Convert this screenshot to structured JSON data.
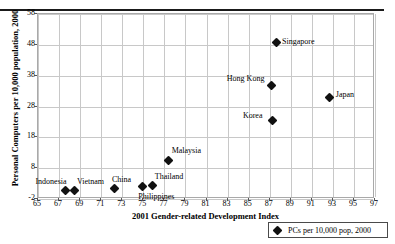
{
  "chart_data": {
    "type": "scatter",
    "title": "",
    "xlabel": "2001 Gender-related Development Index",
    "ylabel": "Personal Computers per 10,000 population, 2000",
    "xlim": [
      65,
      97
    ],
    "ylim": [
      -2,
      58
    ],
    "xticks": [
      65,
      67,
      69,
      71,
      73,
      75,
      77,
      79,
      81,
      83,
      85,
      87,
      89,
      91,
      93,
      95,
      97
    ],
    "yticks": [
      -2,
      8,
      18,
      28,
      38,
      48,
      58
    ],
    "grid": true,
    "legend_position": "bottom-right",
    "legend": [
      "PCs per 10,000 pop, 2000"
    ],
    "marker_color": "#111111",
    "marker_shape": "diamond",
    "points": [
      {
        "label": "Indonesia",
        "x": 67.7,
        "y": 0.5,
        "label_dx": -30,
        "label_dy": -13
      },
      {
        "label": "Vietnam",
        "x": 68.6,
        "y": 0.5,
        "label_dx": 2,
        "label_dy": -13
      },
      {
        "label": "China",
        "x": 72.4,
        "y": 1.0,
        "label_dx": -3,
        "label_dy": -14
      },
      {
        "label": "Philippines",
        "x": 75.0,
        "y": 1.6,
        "label_dx": -4,
        "label_dy": 5
      },
      {
        "label": "Thailand",
        "x": 76.0,
        "y": 1.9,
        "label_dx": 2,
        "label_dy": -14
      },
      {
        "label": "Malaysia",
        "x": 77.5,
        "y": 10.2,
        "label_dx": 3,
        "label_dy": -14
      },
      {
        "label": "Korea",
        "x": 87.4,
        "y": 23.0,
        "label_dx": -30,
        "label_dy": -10
      },
      {
        "label": "Hong Kong",
        "x": 87.3,
        "y": 34.5,
        "label_dx": -45,
        "label_dy": -11
      },
      {
        "label": "Singapore",
        "x": 87.7,
        "y": 48.3,
        "label_dx": 6,
        "label_dy": -6
      },
      {
        "label": "Japan",
        "x": 92.8,
        "y": 30.5,
        "label_dx": 6,
        "label_dy": -8
      }
    ]
  }
}
